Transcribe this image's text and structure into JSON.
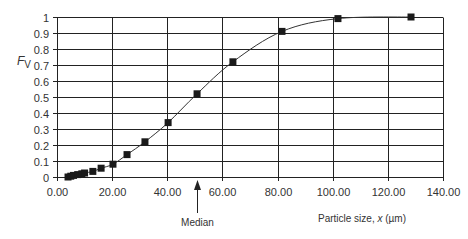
{
  "chart_data": {
    "type": "line",
    "title": "",
    "xlabel": "Particle size, x (µm)",
    "ylabel": "Fv",
    "xlim": [
      0,
      140
    ],
    "ylim": [
      0,
      1
    ],
    "grid": true,
    "legend": null,
    "x_ticks": [
      "0.00",
      "20.00",
      "40.00",
      "60.00",
      "80.00",
      "100.00",
      "120.00",
      "140.00"
    ],
    "y_ticks": [
      "0",
      "0.1",
      "0.2",
      "0.3",
      "0.4",
      "0.5",
      "0.6",
      "0.7",
      "0.8",
      "0.9",
      "1"
    ],
    "series": [
      {
        "name": "Cumulative volume fraction",
        "x": [
          4,
          5,
          6,
          7.5,
          9,
          10,
          13,
          16,
          20.3,
          25.4,
          31.9,
          40.3,
          50.8,
          63.8,
          81.6,
          101.9,
          128.4
        ],
        "y": [
          0.0,
          0.005,
          0.01,
          0.015,
          0.02,
          0.025,
          0.035,
          0.055,
          0.08,
          0.14,
          0.22,
          0.34,
          0.52,
          0.72,
          0.91,
          0.99,
          1.0
        ]
      }
    ],
    "annotations": [
      {
        "text": "Median",
        "x": 50.8,
        "type": "arrow-up-to-axis"
      }
    ]
  },
  "labels": {
    "y_axis_main": "F",
    "y_axis_sub": "V",
    "x_axis_prefix": "Particle size, ",
    "x_axis_var": "x",
    "x_axis_unit": " (µm)",
    "median": "Median"
  }
}
